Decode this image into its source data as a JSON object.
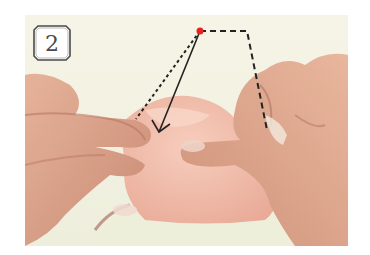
{
  "step": {
    "number": "2"
  },
  "scene": {
    "description": "Two hands folding pink origami paper; diagram overlay shows dashed fold guide and solid arrow pointing to the fold point",
    "colors": {
      "background": "#f4f1e4",
      "skin": "#e0a98c",
      "skin_shadow": "#b9786a",
      "paper": "#f2bfae",
      "table": "#eef0dc",
      "marker_dot": "#e8231b",
      "line": "#222222"
    }
  },
  "overlay": {
    "marker": "red-dot",
    "fold_line": "dashed",
    "arrow": "solid-arrow-down-left"
  }
}
